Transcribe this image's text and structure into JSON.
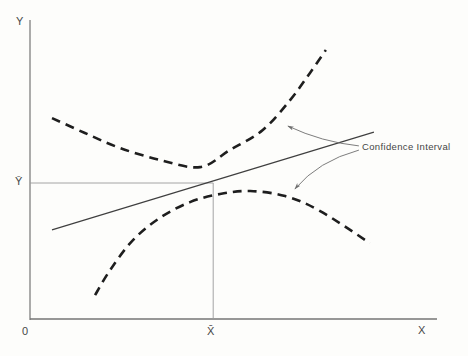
{
  "figure": {
    "background": "#fdfdfb",
    "axis_color": "#757575",
    "curve_color": "#1e1e1e",
    "line_color": "#3f3f3f",
    "ref_color": "#9a9a9a",
    "leader_color": "#6e6e6e",
    "text_color": "#474747"
  },
  "labels": {
    "y_axis": "Y",
    "x_axis": "X",
    "origin": "0",
    "y_mean": "Ȳ",
    "x_mean": "X̄",
    "annotation": "Confidence Interval"
  },
  "chart_data": {
    "type": "line",
    "title": "",
    "xlabel": "X",
    "ylabel": "Y",
    "xlim": [
      0,
      1
    ],
    "ylim": [
      0,
      1
    ],
    "grid": false,
    "legend": "none",
    "axis_markers": {
      "x_mean": {
        "label": "X̄",
        "x": 0.45
      },
      "y_mean": {
        "label": "Ȳ",
        "y": 0.455
      },
      "origin": {
        "label": "0"
      }
    },
    "ref_lines": [
      {
        "name": "y-mean-ref-line",
        "from": [
          0.0,
          0.455
        ],
        "to": [
          0.45,
          0.455
        ]
      },
      {
        "name": "x-mean-ref-line",
        "from": [
          0.45,
          0.0
        ],
        "to": [
          0.45,
          0.455
        ]
      }
    ],
    "series": [
      {
        "name": "regression-line",
        "kind": "straight",
        "dashed": false,
        "width": 1.1,
        "color_key": "line_color",
        "points": [
          [
            0.054,
            0.298
          ],
          [
            0.845,
            0.625
          ]
        ]
      },
      {
        "name": "upper-confidence-band",
        "kind": "smooth",
        "dashed": true,
        "width": 2.6,
        "color_key": "curve_color",
        "points": [
          [
            0.054,
            0.672
          ],
          [
            0.135,
            0.622
          ],
          [
            0.221,
            0.572
          ],
          [
            0.319,
            0.532
          ],
          [
            0.418,
            0.508
          ],
          [
            0.491,
            0.565
          ],
          [
            0.572,
            0.632
          ],
          [
            0.639,
            0.732
          ],
          [
            0.688,
            0.823
          ],
          [
            0.727,
            0.9
          ]
        ]
      },
      {
        "name": "lower-confidence-band",
        "kind": "smooth",
        "dashed": true,
        "width": 2.6,
        "color_key": "curve_color",
        "points": [
          [
            0.16,
            0.08
          ],
          [
            0.197,
            0.164
          ],
          [
            0.253,
            0.264
          ],
          [
            0.319,
            0.338
          ],
          [
            0.393,
            0.391
          ],
          [
            0.467,
            0.418
          ],
          [
            0.541,
            0.428
          ],
          [
            0.627,
            0.411
          ],
          [
            0.713,
            0.361
          ],
          [
            0.835,
            0.254
          ]
        ]
      }
    ],
    "annotations": [
      {
        "text": "Confidence Interval",
        "targets": [
          "upper-confidence-band",
          "lower-confidence-band"
        ],
        "leaders": [
          {
            "name": "leader-to-upper-band",
            "path": [
              [
                0.808,
                0.579
              ],
              [
                0.717,
                0.592
              ],
              [
                0.634,
                0.645
              ]
            ]
          },
          {
            "name": "leader-to-lower-band",
            "path": [
              [
                0.808,
                0.565
              ],
              [
                0.708,
                0.528
              ],
              [
                0.651,
                0.435
              ]
            ]
          }
        ]
      }
    ]
  }
}
